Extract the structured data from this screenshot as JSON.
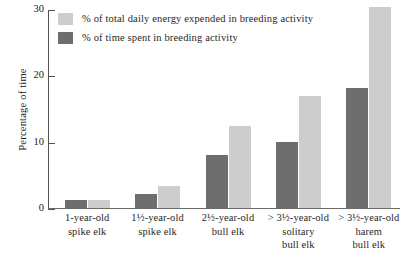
{
  "chart_data": {
    "type": "bar",
    "title": "",
    "xlabel": "",
    "ylabel": "Percentage of time",
    "ylim": [
      0,
      30
    ],
    "yticks": [
      0,
      10,
      20,
      30
    ],
    "grid": false,
    "legend_position": "top-left",
    "categories": [
      "1-year-old spike elk",
      "1½-year-old spike elk",
      "2½-year-old bull elk",
      "> 3½-year-old solitary bull elk",
      "> 3½-year-old harem bull elk"
    ],
    "category_lines": [
      [
        "1-year-old",
        "spike elk"
      ],
      [
        "1½-year-old",
        "spike elk"
      ],
      [
        "2½-year-old",
        "bull elk"
      ],
      [
        "> 3½-year-old",
        "solitary",
        "bull elk"
      ],
      [
        "> 3½-year-old",
        "harem",
        "bull elk"
      ]
    ],
    "series": [
      {
        "name": "% of time spent in breeding activity",
        "color": "#6e6e6e",
        "values": [
          1.1,
          2.0,
          7.9,
          9.9,
          18.0
        ]
      },
      {
        "name": "% of total daily energy expended in breeding activity",
        "color": "#cdcdcd",
        "values": [
          1.1,
          3.3,
          12.3,
          16.7,
          30.2
        ]
      }
    ]
  },
  "legend": {
    "items": [
      {
        "label": "% of total daily energy expended in breeding activity",
        "color": "#cdcdcd"
      },
      {
        "label": "% of time spent in breeding activity",
        "color": "#6e6e6e"
      }
    ]
  },
  "axis": {
    "y_title": "Percentage of time",
    "y_tick_labels": [
      "30",
      "20",
      "10",
      "0"
    ]
  }
}
